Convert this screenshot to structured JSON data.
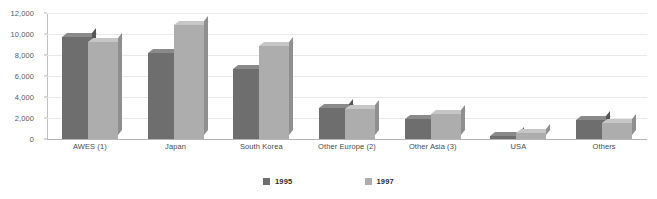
{
  "chart_data": {
    "type": "bar",
    "title": "",
    "subtitle": "",
    "xlabel": "",
    "ylabel": "",
    "ylim": [
      0,
      12000
    ],
    "ytick_labels": [
      "0",
      "2,000",
      "4,000",
      "6,000",
      "8,000",
      "10,000",
      "12,000"
    ],
    "ytick_values": [
      0,
      2000,
      4000,
      6000,
      8000,
      10000,
      12000
    ],
    "grid": true,
    "legend_position": "bottom-center",
    "style": "3d-column",
    "categories": [
      "AWES (1)",
      "Japan",
      "South Korea",
      "Other Europe (2)",
      "Other Asia (3)",
      "USA",
      "Others"
    ],
    "series": [
      {
        "name": "1995",
        "color": "#6e6e6e",
        "values": [
          9700,
          8200,
          6700,
          2950,
          1950,
          300,
          1850
        ]
      },
      {
        "name": "1997",
        "color": "#adadad",
        "values": [
          9200,
          10900,
          8900,
          2900,
          2350,
          550,
          1550
        ]
      }
    ]
  },
  "legend": {
    "items": [
      {
        "label": "1995"
      },
      {
        "label": "1997"
      }
    ]
  }
}
